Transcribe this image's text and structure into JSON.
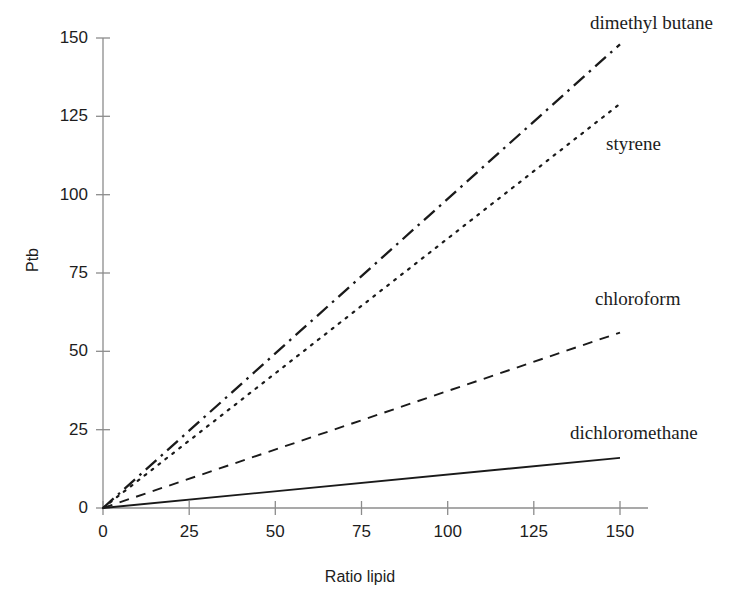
{
  "chart_data": {
    "type": "line",
    "title": "",
    "subtitle": "",
    "xlabel": "Ratio lipid",
    "ylabel": "Ptb",
    "xlim": [
      0,
      150
    ],
    "ylim": [
      0,
      150
    ],
    "xticks": [
      0,
      25,
      50,
      75,
      100,
      125,
      150
    ],
    "yticks": [
      0,
      25,
      50,
      75,
      100,
      125,
      150
    ],
    "xtick_labels": [
      "0",
      "25",
      "50",
      "75",
      "100",
      "125",
      "150"
    ],
    "ytick_labels": [
      "0",
      "25",
      "50",
      "75",
      "100",
      "125",
      "150"
    ],
    "grid": false,
    "legend_position": "inline-right-annotations",
    "x": [
      0,
      150
    ],
    "series": [
      {
        "name": "dimethyl butane",
        "label": "dimethyl butane",
        "linestyle": "dash-dot",
        "color": "#1a1a1a",
        "linewidth": 2.3,
        "x": [
          0,
          150
        ],
        "values": [
          0,
          148
        ],
        "slope": 0.987
      },
      {
        "name": "styrene",
        "label": "styrene",
        "linestyle": "dotted",
        "color": "#1a1a1a",
        "linewidth": 2.2,
        "x": [
          0,
          150
        ],
        "values": [
          0,
          129
        ],
        "slope": 0.86
      },
      {
        "name": "chloroform",
        "label": "chloroform",
        "linestyle": "dashed",
        "color": "#1a1a1a",
        "linewidth": 1.9,
        "x": [
          0,
          150
        ],
        "values": [
          0,
          56
        ],
        "slope": 0.373
      },
      {
        "name": "dichloromethane",
        "label": "dichloromethane",
        "linestyle": "solid",
        "color": "#1a1a1a",
        "linewidth": 1.9,
        "x": [
          0,
          150
        ],
        "values": [
          0,
          16
        ],
        "slope": 0.107
      }
    ]
  },
  "axes": {
    "y_title": "Ptb",
    "x_title": "Ratio lipid",
    "axis_color": "#8c8c8c"
  }
}
